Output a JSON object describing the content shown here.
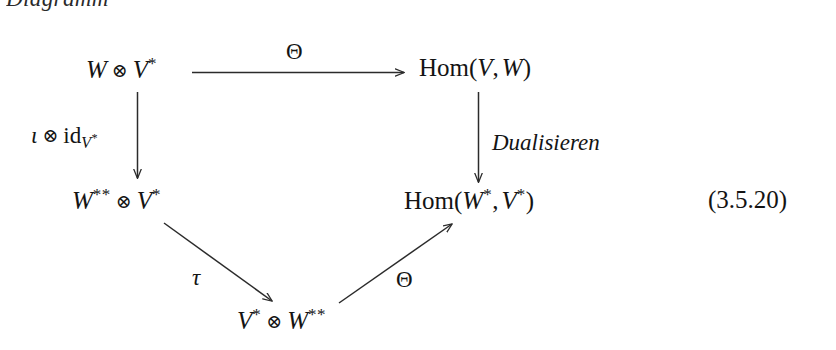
{
  "caption": {
    "word": "Diagramm"
  },
  "diagram": {
    "nodes": [
      {
        "id": "top-left",
        "text": "W ⊗ V*",
        "w": "W",
        "star_w": "",
        "v": "V",
        "star_v": "*"
      },
      {
        "id": "top-right",
        "text": "Hom(V, W)"
      },
      {
        "id": "mid-left",
        "text": "W** ⊗ V*"
      },
      {
        "id": "mid-right",
        "text": "Hom(W*, V*)"
      },
      {
        "id": "bottom",
        "text": "V* ⊗ W**"
      }
    ],
    "node_labels": {
      "top_left_w": "W",
      "top_left_v": "V",
      "top_right_hom": "Hom",
      "top_right_arg1": "V",
      "top_right_arg2": "W",
      "mid_left_w": "W",
      "mid_left_v": "V",
      "mid_right_hom": "Hom",
      "mid_right_arg1": "W",
      "mid_right_arg2": "V",
      "bottom_v": "V",
      "bottom_w": "W"
    },
    "symbols": {
      "tensor": "⊗",
      "star": "*",
      "double_star": "**",
      "comma": ","
    },
    "arrows": [
      {
        "id": "top-horizontal",
        "label": "Θ",
        "from": "W ⊗ V*",
        "to": "Hom(V, W)",
        "style": "solid"
      },
      {
        "id": "left-vertical",
        "label": "ι ⊗ id_{V*}",
        "from": "W ⊗ V*",
        "to": "W** ⊗ V*",
        "style": "solid"
      },
      {
        "id": "right-vertical",
        "label": "Dualisieren",
        "from": "Hom(V, W)",
        "to": "Hom(W*, V*)",
        "style": "solid"
      },
      {
        "id": "left-diagonal",
        "label": "τ",
        "from": "W** ⊗ V*",
        "to": "V* ⊗ W**",
        "style": "solid"
      },
      {
        "id": "right-diagonal",
        "label": "Θ",
        "from": "V* ⊗ W**",
        "to": "Hom(W*, V*)",
        "style": "solid"
      }
    ],
    "arrow_labels": {
      "theta_top": "Θ",
      "iota": "ι",
      "id": "id",
      "id_subscript_base": "V",
      "dualisieren": "Dualisieren",
      "tau": "τ",
      "theta_bottom": "Θ"
    }
  },
  "equation_tag": "(3.5.20)",
  "colors": {
    "background": "#ffffff",
    "ink": "#141414",
    "arrow": "#2b2b2b"
  }
}
